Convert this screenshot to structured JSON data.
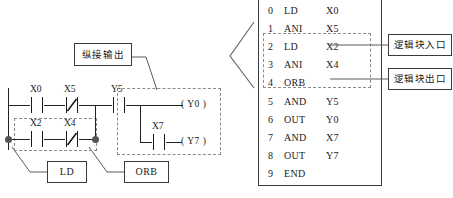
{
  "ladder": {
    "title_callout": "纵接输出",
    "ld_callout": "LD",
    "orb_callout": "ORB",
    "rungs": [
      {
        "name": "branch-top",
        "contacts": [
          {
            "label": "X0",
            "type": "no"
          },
          {
            "label": "X5",
            "type": "nc"
          }
        ]
      },
      {
        "name": "branch-bottom",
        "contacts": [
          {
            "label": "X2",
            "type": "no"
          },
          {
            "label": "X4",
            "type": "nc"
          }
        ]
      }
    ],
    "series_contact": {
      "label": "Y5",
      "type": "no"
    },
    "out_block": {
      "coil_top": "( Y0  )",
      "coil_bottom": "( Y7  )",
      "contact": {
        "label": "X7",
        "type": "no"
      }
    }
  },
  "instruction_list": {
    "rows": [
      {
        "step": "0",
        "op": "LD",
        "operand": "X0"
      },
      {
        "step": "1",
        "op": "ANI",
        "operand": "X5"
      },
      {
        "step": "2",
        "op": "LD",
        "operand": "X2"
      },
      {
        "step": "3",
        "op": "ANI",
        "operand": "X4"
      },
      {
        "step": "4",
        "op": "ORB",
        "operand": ""
      },
      {
        "step": "5",
        "op": "AND",
        "operand": "Y5"
      },
      {
        "step": "6",
        "op": "OUT",
        "operand": "Y0"
      },
      {
        "step": "7",
        "op": "AND",
        "operand": "X7"
      },
      {
        "step": "8",
        "op": "OUT",
        "operand": "Y7"
      },
      {
        "step": "9",
        "op": "END",
        "operand": ""
      }
    ]
  },
  "annotations": {
    "block_entry": "逻辑块入口",
    "block_exit": "逻辑块出口"
  },
  "colors": {
    "line": "#222222",
    "dashed": "#8a8a8a",
    "node": "#555555",
    "text": "#1a1a1a"
  }
}
